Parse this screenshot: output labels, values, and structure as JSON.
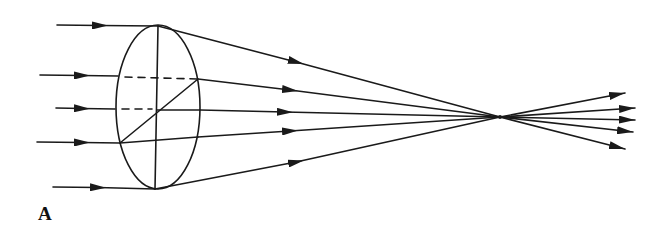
{
  "figure": {
    "panel_label": "A",
    "stroke_color": "#1a1a1a",
    "lens": {
      "cx": 158,
      "cy": 107,
      "rx": 42,
      "ry": 82
    },
    "focal_point": {
      "x": 500,
      "y": 117
    },
    "incoming_rays": [
      {
        "x_start": 57,
        "y": 26,
        "x_lens": 158
      },
      {
        "x_start": 40,
        "y": 75,
        "x_lens": 118
      },
      {
        "x_start": 56,
        "y": 108,
        "x_lens": 115
      },
      {
        "x_start": 37,
        "y": 142,
        "x_lens": 120
      },
      {
        "x_start": 53,
        "y": 187,
        "x_lens": 155
      }
    ],
    "outgoing_ray_ends": [
      {
        "x": 625,
        "y": 93
      },
      {
        "x": 635,
        "y": 106
      },
      {
        "x": 635,
        "y": 118
      },
      {
        "x": 633,
        "y": 131
      },
      {
        "x": 625,
        "y": 148
      }
    ]
  }
}
